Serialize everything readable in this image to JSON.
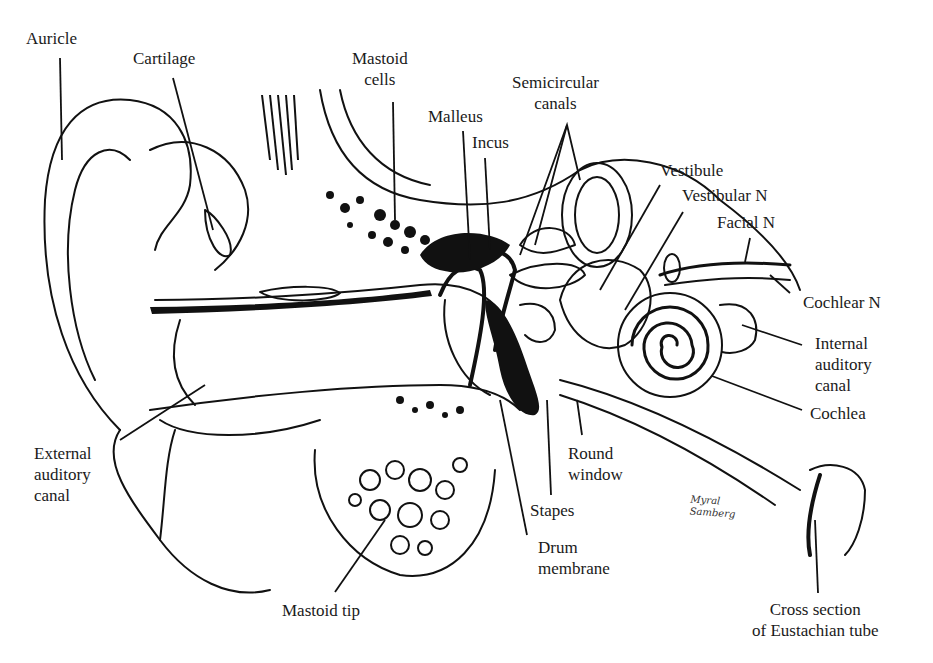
{
  "diagram": {
    "labels": {
      "auricle": "Auricle",
      "cartilage": "Cartilage",
      "mastoid_cells": [
        "Mastoid",
        "cells"
      ],
      "malleus": "Malleus",
      "incus": "Incus",
      "semicircular_canals": [
        "Semicircular",
        "canals"
      ],
      "vestibule": "Vestibule",
      "vestibular_n": "Vestibular N",
      "facial_n": "Facial N",
      "cochlear_n": "Cochlear N",
      "internal_auditory_canal": [
        "Internal",
        "auditory",
        "canal"
      ],
      "cochlea": "Cochlea",
      "external_auditory_canal": [
        "External",
        "auditory",
        "canal"
      ],
      "round_window": [
        "Round",
        "window"
      ],
      "stapes": "Stapes",
      "drum_membrane": [
        "Drum",
        "membrane"
      ],
      "mastoid_tip": "Mastoid tip",
      "eustachian_tube": [
        "Cross section",
        "of Eustachian tube"
      ]
    },
    "signature": [
      "Myral",
      "Samberg"
    ]
  }
}
